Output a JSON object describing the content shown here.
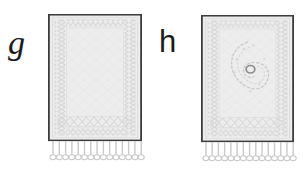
{
  "figure": {
    "type": "line-drawing-plate",
    "caption_labels": [
      "g",
      "h"
    ],
    "background_color": "#ffffff",
    "outline_color": "#3a3a3a",
    "field_color": "#ededed",
    "border_color": "#e2e2e2",
    "pattern_color": "#d9d9d9",
    "medallion_color": "#bdbdbd",
    "fringe_color": "#cfcfcf"
  },
  "panels": [
    {
      "id": "g",
      "label": "g",
      "object_name": "rug",
      "description": "plain-field rug with zigzag guard borders and knotted fringe",
      "has_medallion": false,
      "fringe_count": 15,
      "border_bands": 3,
      "field_fill": "#ededed",
      "outline": "#3a3a3a"
    },
    {
      "id": "h",
      "label": "h",
      "object_name": "rug",
      "description": "rug with central paisley medallion, zigzag guard borders and knotted fringe",
      "has_medallion": true,
      "medallion_shape": "paisley",
      "medallion_center_marker": "small ring",
      "fringe_count": 15,
      "border_bands": 3,
      "field_fill": "#ededed",
      "outline": "#3a3a3a"
    }
  ]
}
